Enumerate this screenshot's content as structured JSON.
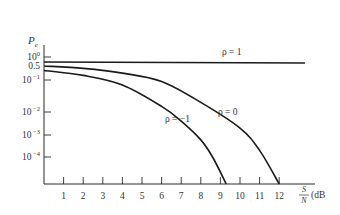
{
  "chart_data": {
    "type": "line",
    "title": "",
    "ylabel": "P_e",
    "ylabel_main": "P",
    "ylabel_sub": "e",
    "xlabel": "S/N (dB)",
    "xlabel_num": "S",
    "xlabel_den": "N",
    "xlabel_unit": "(dB",
    "yscale": "log",
    "xlim": [
      0,
      13
    ],
    "grid": false,
    "x_ticks": [
      "1",
      "2",
      "3",
      "4",
      "5",
      "6",
      "7",
      "8",
      "9",
      "10",
      "11",
      "12"
    ],
    "y_ticks": [
      {
        "base": "10",
        "exp": "0",
        "value": 1
      },
      {
        "base": "0.5",
        "exp": "",
        "value": 0.5
      },
      {
        "base": "10",
        "exp": " −1",
        "value": 0.1
      },
      {
        "base": "10",
        "exp": " −2",
        "value": 0.01
      },
      {
        "base": "10",
        "exp": " −3",
        "value": 0.001
      },
      {
        "base": "10",
        "exp": " −4",
        "value": 0.0001
      }
    ],
    "series": [
      {
        "name": "ρ = 1",
        "x": [
          0,
          13
        ],
        "y": [
          0.7,
          0.7
        ]
      },
      {
        "name": "ρ = 0",
        "x": [
          0,
          2,
          4,
          6,
          8,
          10,
          11,
          12
        ],
        "y": [
          0.5,
          0.38,
          0.22,
          0.09,
          0.02,
          0.002,
          0.0002,
          1e-05
        ]
      },
      {
        "name": "ρ = −1",
        "x": [
          0,
          2,
          4,
          6,
          7,
          8,
          8.6,
          9.3
        ],
        "y": [
          0.3,
          0.17,
          0.07,
          0.015,
          0.004,
          0.0006,
          0.0001,
          1e-05
        ]
      }
    ],
    "annotations": [
      {
        "text": "ρ = 1",
        "series": 0
      },
      {
        "text": "ρ = 0",
        "series": 1
      },
      {
        "text": "ρ = −1",
        "series": 2
      }
    ]
  }
}
